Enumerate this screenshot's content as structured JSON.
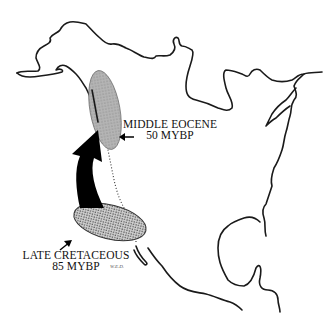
{
  "map": {
    "region": "North America",
    "regions": [
      {
        "id": "middle-eocene",
        "label_line1": "MIDDLE EOCENE",
        "label_line2": "50 MYBP",
        "fill": "#a8a8a8"
      },
      {
        "id": "late-cretaceous",
        "label_line1": "LATE CRETACEOUS",
        "label_line2": "85 MYBP",
        "fill": "#bdbdbd"
      }
    ],
    "migration_arrow": {
      "from": "late-cretaceous",
      "to": "middle-eocene",
      "color": "#000000"
    },
    "signature": "W.E.D."
  }
}
